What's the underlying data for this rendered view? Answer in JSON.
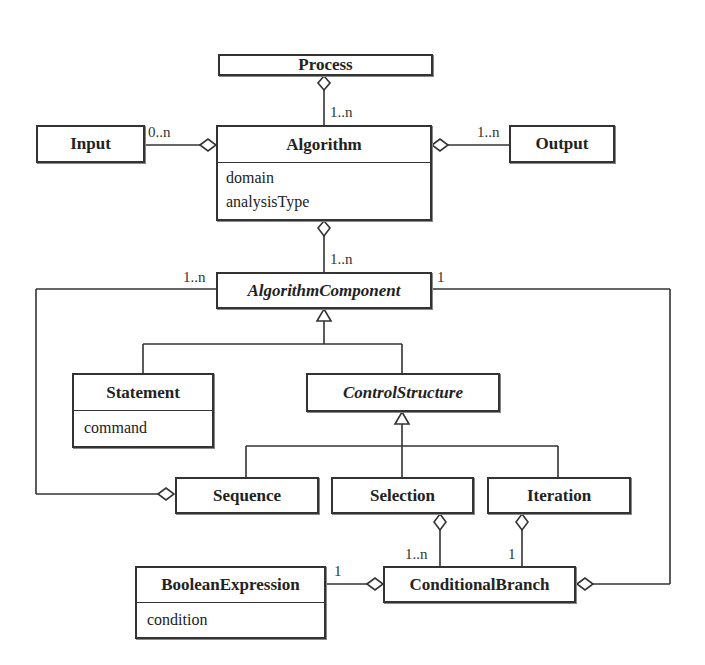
{
  "diagram": {
    "type": "UML class diagram",
    "classes": [
      {
        "id": "process",
        "name": "Process",
        "abstract": false,
        "attributes": []
      },
      {
        "id": "input",
        "name": "Input",
        "abstract": false,
        "attributes": []
      },
      {
        "id": "algorithm",
        "name": "Algorithm",
        "abstract": false,
        "attributes": [
          "domain",
          "analysisType"
        ]
      },
      {
        "id": "output",
        "name": "Output",
        "abstract": false,
        "attributes": []
      },
      {
        "id": "algorithm_component",
        "name": "AlgorithmComponent",
        "abstract": true,
        "attributes": []
      },
      {
        "id": "statement",
        "name": "Statement",
        "abstract": false,
        "attributes": [
          "command"
        ]
      },
      {
        "id": "control_structure",
        "name": "ControlStructure",
        "abstract": true,
        "attributes": []
      },
      {
        "id": "sequence",
        "name": "Sequence",
        "abstract": false,
        "attributes": []
      },
      {
        "id": "selection",
        "name": "Selection",
        "abstract": false,
        "attributes": []
      },
      {
        "id": "iteration",
        "name": "Iteration",
        "abstract": false,
        "attributes": []
      },
      {
        "id": "boolean_expression",
        "name": "BooleanExpression",
        "abstract": false,
        "attributes": [
          "condition"
        ]
      },
      {
        "id": "conditional_branch",
        "name": "ConditionalBranch",
        "abstract": false,
        "attributes": []
      }
    ],
    "multiplicities": {
      "process_algorithm": "1..n",
      "input_algorithm": "0..n",
      "output_algorithm": "1..n",
      "algorithm_component": "1..n",
      "sequence_component": "1..n",
      "branch_component": "1",
      "selection_branch": "1..n",
      "iteration_branch": "1",
      "boolean_branch": "1"
    },
    "relationships": [
      {
        "type": "aggregation",
        "whole": "Process",
        "part": "Algorithm",
        "multiplicity": "1..n"
      },
      {
        "type": "aggregation",
        "whole": "Algorithm",
        "part": "Input",
        "multiplicity": "0..n"
      },
      {
        "type": "aggregation",
        "whole": "Algorithm",
        "part": "Output",
        "multiplicity": "1..n"
      },
      {
        "type": "aggregation",
        "whole": "Algorithm",
        "part": "AlgorithmComponent",
        "multiplicity": "1..n"
      },
      {
        "type": "generalization",
        "parent": "AlgorithmComponent",
        "child": "Statement"
      },
      {
        "type": "generalization",
        "parent": "AlgorithmComponent",
        "child": "ControlStructure"
      },
      {
        "type": "generalization",
        "parent": "ControlStructure",
        "child": "Sequence"
      },
      {
        "type": "generalization",
        "parent": "ControlStructure",
        "child": "Selection"
      },
      {
        "type": "generalization",
        "parent": "ControlStructure",
        "child": "Iteration"
      },
      {
        "type": "aggregation",
        "whole": "Sequence",
        "part": "AlgorithmComponent",
        "multiplicity": "1..n"
      },
      {
        "type": "aggregation",
        "whole": "Selection",
        "part": "ConditionalBranch",
        "multiplicity": "1..n"
      },
      {
        "type": "aggregation",
        "whole": "Iteration",
        "part": "ConditionalBranch",
        "multiplicity": "1"
      },
      {
        "type": "aggregation",
        "whole": "ConditionalBranch",
        "part": "BooleanExpression",
        "multiplicity": "1"
      },
      {
        "type": "aggregation",
        "whole": "ConditionalBranch",
        "part": "AlgorithmComponent",
        "multiplicity": "1"
      }
    ]
  },
  "labels": {
    "process": "Process",
    "input": "Input",
    "algorithm": "Algorithm",
    "algorithm_attr_1": "domain",
    "algorithm_attr_2": "analysisType",
    "output": "Output",
    "algorithm_component": "AlgorithmComponent",
    "statement": "Statement",
    "statement_attr_1": "command",
    "control_structure": "ControlStructure",
    "sequence": "Sequence",
    "selection": "Selection",
    "iteration": "Iteration",
    "boolean_expression": "BooleanExpression",
    "boolean_expression_attr_1": "condition",
    "conditional_branch": "ConditionalBranch"
  },
  "colors": {
    "line": "#333333",
    "background": "#ffffff"
  }
}
